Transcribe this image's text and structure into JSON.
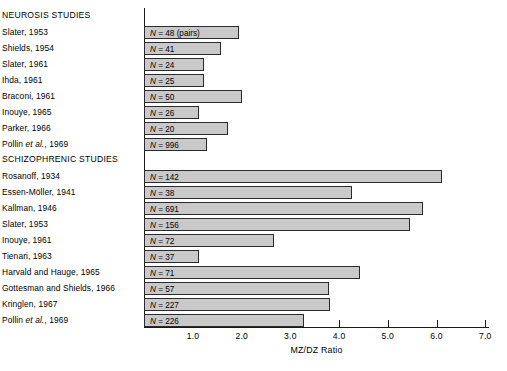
{
  "chart_data": {
    "type": "bar",
    "orientation": "horizontal",
    "title": "",
    "xlabel": "MZ/DZ Ratio",
    "ylabel": "",
    "xlim": [
      0.0,
      7.2
    ],
    "xticks": [
      1.0,
      2.0,
      3.0,
      4.0,
      5.0,
      6.0,
      7.0
    ],
    "xtick_labels": [
      "1.0",
      "2.0",
      "3.0",
      "4.0",
      "5.0",
      "6.0",
      "7.0"
    ],
    "grid": false,
    "legend": null,
    "sections": [
      {
        "heading": "NEUROSIS STUDIES",
        "rows": [
          {
            "label": "Slater, 1953",
            "n_text": "N = 48 (pairs)",
            "n": 48,
            "value": 1.94
          },
          {
            "label": "Shields, 1954",
            "n_text": "N = 41",
            "n": 41,
            "value": 1.57
          },
          {
            "label": "Slater, 1961",
            "n_text": "N = 24",
            "n": 24,
            "value": 1.22
          },
          {
            "label": "Ihda, 1961",
            "n_text": "N = 25",
            "n": 25,
            "value": 1.22
          },
          {
            "label": "Braconi, 1961",
            "n_text": "N = 50",
            "n": 50,
            "value": 2.0
          },
          {
            "label": "Inouye, 1965",
            "n_text": "N = 26",
            "n": 26,
            "value": 1.12
          },
          {
            "label": "Parker, 1966",
            "n_text": "N = 20",
            "n": 20,
            "value": 1.72
          },
          {
            "label": "Pollin et al., 1969",
            "n_text": "N = 996",
            "n": 996,
            "value": 1.29
          }
        ]
      },
      {
        "heading": "SCHIZOPHRENIC STUDIES",
        "rows": [
          {
            "label": "Rosanoff, 1934",
            "n_text": "N = 142",
            "n": 142,
            "value": 6.11
          },
          {
            "label": "Essen-Möller, 1941",
            "n_text": "N = 38",
            "n": 38,
            "value": 4.27
          },
          {
            "label": "Kallman, 1946",
            "n_text": "N = 691",
            "n": 691,
            "value": 5.72
          },
          {
            "label": "Slater, 1953",
            "n_text": "N = 156",
            "n": 156,
            "value": 5.45
          },
          {
            "label": "Inouye, 1961",
            "n_text": "N = 72",
            "n": 72,
            "value": 2.66
          },
          {
            "label": "Tienari, 1963",
            "n_text": "N = 37",
            "n": 37,
            "value": 1.12
          },
          {
            "label": "Harvald and Hauge, 1965",
            "n_text": "N = 71",
            "n": 71,
            "value": 4.43
          },
          {
            "label": "Gottesman and Shields, 1966",
            "n_text": "N = 57",
            "n": 57,
            "value": 3.79
          },
          {
            "label": "Kringlen, 1967",
            "n_text": "N = 227",
            "n": 227,
            "value": 3.81
          },
          {
            "label": "Pollin et al., 1969",
            "n_text": "N = 226",
            "n": 226,
            "value": 3.28
          }
        ]
      }
    ],
    "colors": {
      "bar_fill": "#c9c9c9",
      "bar_border": "#2b2b2b",
      "axis": "#1a1a1a",
      "text": "#000000",
      "background": "#ffffff"
    }
  }
}
